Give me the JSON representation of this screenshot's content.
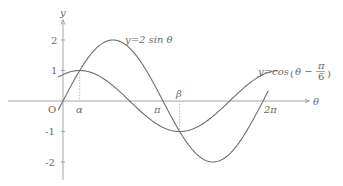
{
  "chart_data": {
    "type": "line",
    "title": "",
    "xlabel": "θ",
    "ylabel": "y",
    "origin_label": "O",
    "x_ticks": [
      {
        "label": "α",
        "value": 0.5236
      },
      {
        "label": "π",
        "value": 3.1416
      },
      {
        "label": "β",
        "value": 3.6652
      },
      {
        "label": "2π",
        "value": 6.2832
      }
    ],
    "y_ticks": [
      {
        "label": "2",
        "value": 2
      },
      {
        "label": "1",
        "value": 1
      },
      {
        "label": "-1",
        "value": -1
      },
      {
        "label": "-2",
        "value": -2
      }
    ],
    "xlim": [
      -0.2,
      7.6
    ],
    "ylim": [
      -2.5,
      2.6
    ],
    "grid": false,
    "series": [
      {
        "name": "y=2sinθ",
        "label": "y=2 sin θ",
        "function": "2*sin(theta)",
        "domain": [
          -0.15,
          6.45
        ]
      },
      {
        "name": "y=cos(θ−π/6)",
        "label_prefix": "y=cos",
        "label_inner": "θ −",
        "label_frac_num": "π",
        "label_frac_den": "6",
        "function": "cos(theta - pi/6)",
        "domain": [
          -0.15,
          6.75
        ]
      }
    ],
    "annotations": [
      {
        "type": "intersection",
        "label": "α",
        "x": 0.5236,
        "y": 1
      },
      {
        "type": "intersection",
        "label": "β",
        "x": 3.6652,
        "y": -1
      }
    ]
  }
}
